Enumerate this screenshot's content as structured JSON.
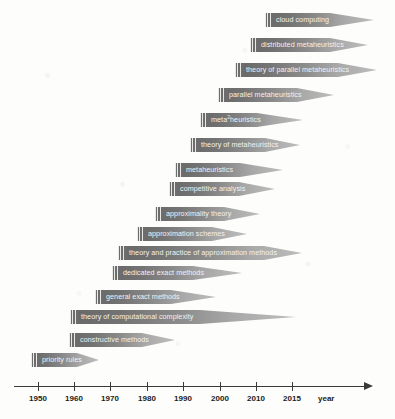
{
  "figure": {
    "type": "timeline-gantt",
    "axis": {
      "title": "year",
      "ticks": [
        {
          "label": "1950",
          "x": 38
        },
        {
          "label": "1960",
          "x": 74
        },
        {
          "label": "1970",
          "x": 110
        },
        {
          "label": "1980",
          "x": 147
        },
        {
          "label": "1990",
          "x": 183
        },
        {
          "label": "2000",
          "x": 220
        },
        {
          "label": "2010",
          "x": 256
        },
        {
          "label": "2015",
          "x": 292
        }
      ]
    },
    "colors": {
      "bar_dark": "#676767",
      "bar_light": "#bdbdbd",
      "axis": "#3a3a3a",
      "label_text": "#f2f2f0",
      "background": "#fdfdfb"
    },
    "bars": [
      {
        "label": "cloud computing",
        "start_year": 2012.0,
        "x": 265,
        "body_end": 330,
        "tip_end": 374,
        "y": 13
      },
      {
        "label": "distributed metaheuristics",
        "start_year": 2009.5,
        "x": 250,
        "body_end": 330,
        "tip_end": 368,
        "y": 38
      },
      {
        "label": "theory of parallel metaheuristics",
        "start_year": 2007.0,
        "x": 235,
        "body_end": 338,
        "tip_end": 377,
        "y": 63
      },
      {
        "label": "parallel metaheuristics",
        "start_year": 2003.5,
        "x": 218,
        "body_end": 297,
        "tip_end": 334,
        "y": 88
      },
      {
        "label": "meta²heuristics",
        "start_year": 1998.0,
        "x": 200,
        "body_end": 257,
        "tip_end": 303,
        "y": 113
      },
      {
        "label": "theory of metaheuristics",
        "start_year": 1995.0,
        "x": 190,
        "body_end": 265,
        "tip_end": 300,
        "y": 138
      },
      {
        "label": "metaheuristics",
        "start_year": 1991.0,
        "x": 175,
        "body_end": 240,
        "tip_end": 283,
        "y": 163
      },
      {
        "label": "competitive analysis",
        "start_year": 1989.0,
        "x": 169,
        "body_end": 239,
        "tip_end": 275,
        "y": 182
      },
      {
        "label": "approximality theory",
        "start_year": 1985.0,
        "x": 155,
        "body_end": 224,
        "tip_end": 260,
        "y": 207
      },
      {
        "label": "approximation schemes",
        "start_year": 1980.0,
        "x": 137,
        "body_end": 212,
        "tip_end": 247,
        "y": 227
      },
      {
        "label": "theory and practice of approximation methods",
        "start_year": 1974.0,
        "x": 118,
        "body_end": 264,
        "tip_end": 302,
        "y": 246
      },
      {
        "label": "dedicated exact methods",
        "start_year": 1972.0,
        "x": 112,
        "body_end": 193,
        "tip_end": 242,
        "y": 266
      },
      {
        "label": "general exact methods",
        "start_year": 1967.0,
        "x": 95,
        "body_end": 171,
        "tip_end": 216,
        "y": 290
      },
      {
        "label": "theory of computational complexity",
        "start_year": 1960.0,
        "x": 70,
        "body_end": 200,
        "tip_end": 296,
        "y": 310
      },
      {
        "label": "constructive methods",
        "start_year": 1960.0,
        "x": 69,
        "body_end": 142,
        "tip_end": 175,
        "y": 333
      },
      {
        "label": "priority rules",
        "start_year": 1948.0,
        "x": 31,
        "body_end": 77,
        "tip_end": 99,
        "y": 353
      }
    ]
  }
}
